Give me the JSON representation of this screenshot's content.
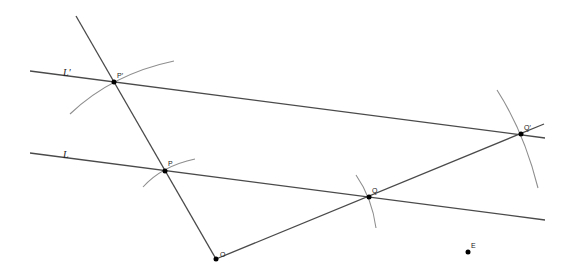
{
  "diagram": {
    "lines": [
      {
        "id": "L",
        "label": "L"
      },
      {
        "id": "Lprime",
        "label": "L′"
      }
    ],
    "points": [
      {
        "id": "O",
        "label": "O"
      },
      {
        "id": "P",
        "label": "P"
      },
      {
        "id": "Q",
        "label": "Q"
      },
      {
        "id": "Pprime",
        "label": "P′"
      },
      {
        "id": "Qprime",
        "label": "Q′"
      },
      {
        "id": "E",
        "label": "E"
      }
    ],
    "colors": {
      "line": "#4a4a4a",
      "arc": "#8e8e8e",
      "point": "#000000",
      "background": "#ffffff"
    }
  }
}
